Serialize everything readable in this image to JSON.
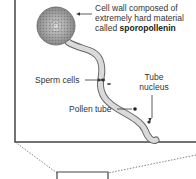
{
  "diagram": {
    "labels": {
      "cell_wall_line1": "Cell wall composed of",
      "cell_wall_line2": "extremely hard material",
      "cell_wall_line3_prefix": "called ",
      "cell_wall_line3_bold": "sporopollenin",
      "sperm_cells": "Sperm cells",
      "tube_nucleus_line1": "Tube",
      "tube_nucleus_line2": "nucleus",
      "pollen_tube": "Pollen tube"
    },
    "colors": {
      "border": "#444444",
      "text": "#333333",
      "grain": "#9a9a9a",
      "tube_fill": "#d8d8d8"
    }
  }
}
